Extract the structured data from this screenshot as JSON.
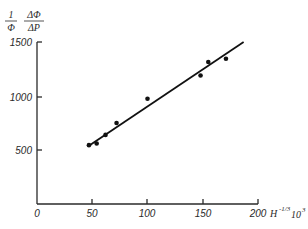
{
  "chart_data": {
    "type": "scatter",
    "title": "",
    "ylabel": "(1/Φ)·(ΔΦ/ΔP)",
    "ylabel_parts": {
      "num1": "1",
      "den1": "Φ",
      "num2": "ΔΦ",
      "den2": "ΔP"
    },
    "xlabel": "H^-1/3 10^3",
    "xlabel_parts": {
      "base": "H",
      "exp": "-1/3",
      "mult": "10",
      "mult_exp": "3"
    },
    "xlim": [
      0,
      200
    ],
    "ylim": [
      0,
      1500
    ],
    "x_ticks": [
      0,
      50,
      100,
      150,
      200
    ],
    "y_ticks": [
      500,
      1000,
      1500
    ],
    "x_tick_labels": [
      "0",
      "50",
      "100",
      "150",
      "200"
    ],
    "y_tick_labels": [
      "500",
      "1000",
      "1500"
    ],
    "grid": false,
    "legend": null,
    "series": [
      {
        "name": "measurements",
        "marker": "filled-circle",
        "x": [
          47,
          54,
          62,
          72,
          100,
          148,
          155,
          171
        ],
        "y": [
          545,
          560,
          640,
          750,
          975,
          1190,
          1315,
          1345
        ]
      },
      {
        "name": "linear fit",
        "style": "line",
        "x": [
          47,
          187
        ],
        "y": [
          540,
          1500
        ]
      }
    ]
  }
}
